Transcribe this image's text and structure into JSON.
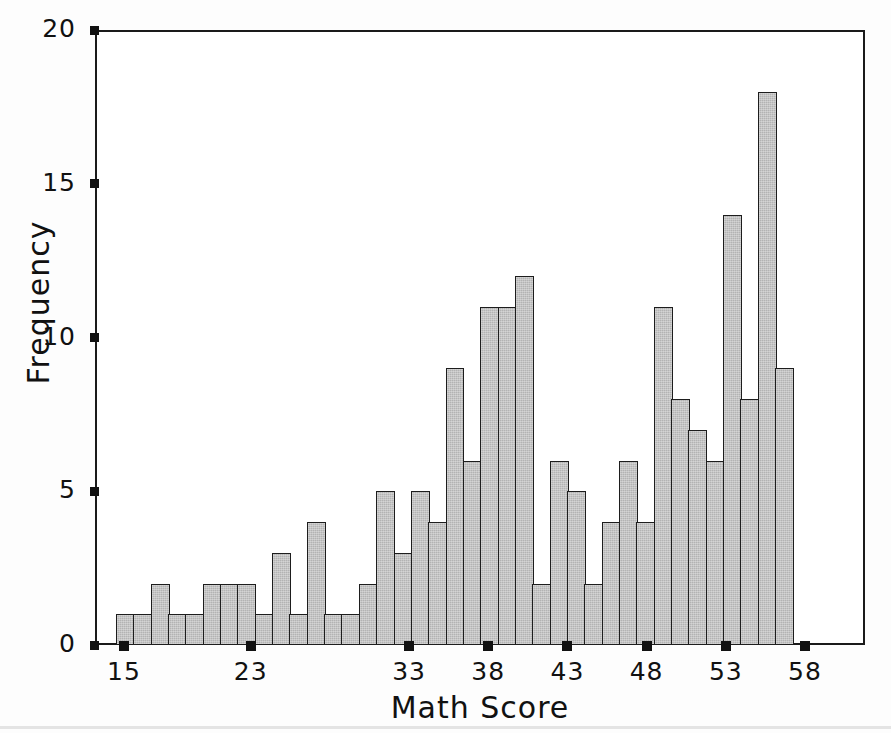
{
  "chart_data": {
    "type": "bar",
    "title": "",
    "subtitle": "",
    "xlabel": "Math Score",
    "ylabel": "Frequency",
    "ylim": [
      0,
      20
    ],
    "ytick_labels": [
      "0",
      "5",
      "10",
      "15",
      "20"
    ],
    "ytick_values": [
      0,
      5,
      10,
      15,
      20
    ],
    "xtick_labels": [
      "15",
      "23",
      "33",
      "38",
      "43",
      "48",
      "53",
      "58"
    ],
    "xtick_values": [
      15,
      23,
      33,
      38,
      43,
      48,
      53,
      58
    ],
    "grid": false,
    "legend": null,
    "bar_color": "#b3b3b3",
    "bar_edge_color": "#1d1d1d",
    "axis_color": "#1a1a1a",
    "background": "#ffffff",
    "n_bins": 39,
    "categories": [
      "15",
      "16",
      "17",
      "18",
      "19",
      "20",
      "21",
      "22",
      "23",
      "24",
      "25",
      "26",
      "27",
      "28",
      "29",
      "30",
      "31",
      "32",
      "33",
      "34",
      "35",
      "36",
      "37",
      "38",
      "39",
      "40",
      "41",
      "42",
      "43",
      "44",
      "45",
      "46",
      "47",
      "48",
      "49",
      "50",
      "51",
      "52",
      "53"
    ],
    "values": [
      1,
      1,
      2,
      1,
      1,
      2,
      2,
      2,
      1,
      3,
      1,
      4,
      1,
      1,
      2,
      5,
      3,
      5,
      4,
      9,
      6,
      11,
      11,
      12,
      2,
      6,
      5,
      2,
      4,
      6,
      4,
      11,
      8,
      7,
      6,
      14,
      8,
      18,
      9
    ]
  },
  "axes": {
    "y_title": "Frequency",
    "x_title": "Math Score"
  }
}
